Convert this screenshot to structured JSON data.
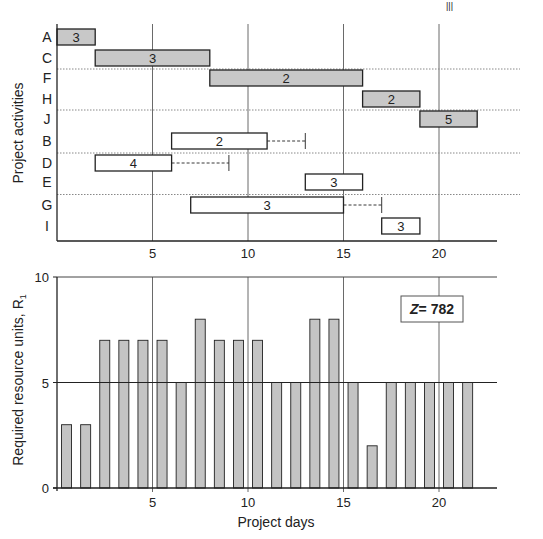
{
  "corner_mark": "|||",
  "chart_data": [
    {
      "type": "gantt",
      "title": "",
      "xlabel": "",
      "ylabel": "Project activities",
      "xlim": [
        0,
        23
      ],
      "xticks": [
        5,
        10,
        15,
        20
      ],
      "categories": [
        "A",
        "C",
        "F",
        "H",
        "J",
        "B",
        "D",
        "E",
        "G",
        "I"
      ],
      "tasks": [
        {
          "id": "A",
          "start": 0,
          "end": 2,
          "label": "3",
          "critical": true,
          "float_end": null
        },
        {
          "id": "C",
          "start": 2,
          "end": 8,
          "label": "3",
          "critical": true,
          "float_end": null
        },
        {
          "id": "F",
          "start": 8,
          "end": 16,
          "label": "2",
          "critical": true,
          "float_end": null
        },
        {
          "id": "H",
          "start": 16,
          "end": 19,
          "label": "2",
          "critical": true,
          "float_end": null
        },
        {
          "id": "J",
          "start": 19,
          "end": 22,
          "label": "5",
          "critical": true,
          "float_end": null
        },
        {
          "id": "B",
          "start": 6,
          "end": 11,
          "label": "2",
          "critical": false,
          "float_end": 13
        },
        {
          "id": "D",
          "start": 2,
          "end": 6,
          "label": "4",
          "critical": false,
          "float_end": 9
        },
        {
          "id": "E",
          "start": 13,
          "end": 16,
          "label": "3",
          "critical": false,
          "float_end": null
        },
        {
          "id": "G",
          "start": 7,
          "end": 15,
          "label": "3",
          "critical": false,
          "float_end": 17
        },
        {
          "id": "I",
          "start": 17,
          "end": 19,
          "label": "3",
          "critical": false,
          "float_end": null
        }
      ],
      "separators_after": [
        "C",
        "H",
        "B",
        "E"
      ],
      "grid": "vertical at 5,10,15,20"
    },
    {
      "type": "bar",
      "title": "",
      "xlabel": "Project days",
      "ylabel": "Required resource units, R",
      "ylabel_subscript": "1",
      "xlim": [
        0,
        23
      ],
      "ylim": [
        0,
        10
      ],
      "xticks": [
        5,
        10,
        15,
        20
      ],
      "yticks": [
        0,
        5,
        10
      ],
      "categories": [
        1,
        2,
        3,
        4,
        5,
        6,
        7,
        8,
        9,
        10,
        11,
        12,
        13,
        14,
        15,
        16,
        17,
        18,
        19,
        20,
        21,
        22
      ],
      "values": [
        3,
        3,
        7,
        7,
        7,
        7,
        5,
        8,
        7,
        7,
        7,
        5,
        5,
        8,
        8,
        5,
        2,
        5,
        5,
        5,
        5,
        5
      ],
      "reference_line": 5,
      "annotation": "Z = 782",
      "annotation_var": "Z",
      "annotation_value": "= 782",
      "grid": "vertical at 5,10,15,20; horizontal at 5,10"
    }
  ],
  "colors": {
    "critical_fill": "#c8c8c8",
    "bar_fill": "#c4c4c4",
    "noncritical_fill": "#ffffff",
    "stroke": "#222222",
    "grid": "#444444",
    "separator": "#888888"
  }
}
